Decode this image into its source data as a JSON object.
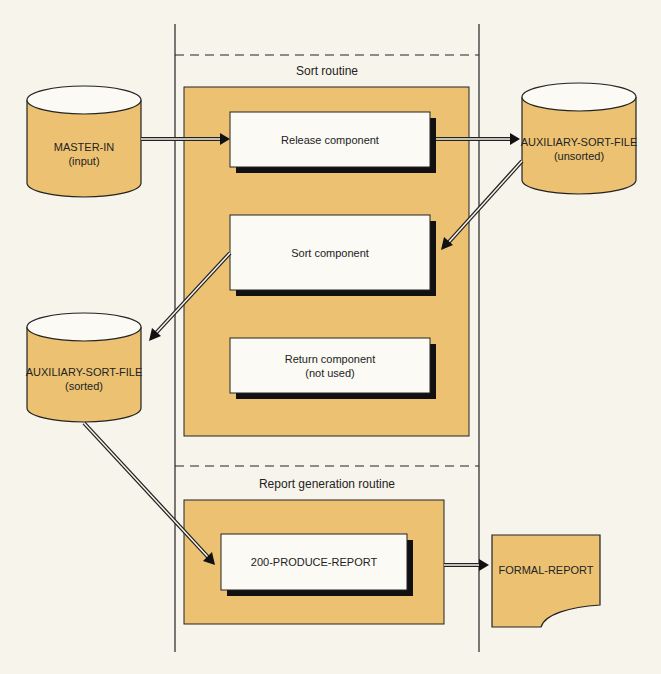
{
  "colors": {
    "background": "#f7f4ec",
    "fill_orange": "#ecc272",
    "box_white": "#fbfaf5",
    "shadow": "#111111",
    "stroke": "#222222"
  },
  "routines": {
    "sort": {
      "title": "Sort routine"
    },
    "report": {
      "title": "Report generation routine"
    }
  },
  "components": {
    "release": {
      "label": "Release component"
    },
    "sort": {
      "label": "Sort component"
    },
    "return": {
      "label": "Return component",
      "sublabel": "(not used)"
    },
    "produce": {
      "label": "200-PRODUCE-REPORT"
    }
  },
  "files": {
    "master_in": {
      "label": "MASTER-IN",
      "sublabel": "(input)"
    },
    "aux_unsorted": {
      "label": "AUXILIARY-SORT-FILE",
      "sublabel": "(unsorted)"
    },
    "aux_sorted": {
      "label": "AUXILIARY-SORT-FILE",
      "sublabel": "(sorted)"
    },
    "formal_report": {
      "label": "FORMAL-REPORT"
    }
  }
}
